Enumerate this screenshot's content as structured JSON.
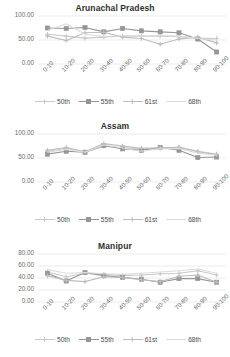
{
  "figure": {
    "categories": [
      "0-10",
      "10-20",
      "20-30",
      "30-40",
      "40-50",
      "50-60",
      "60-70",
      "70-80",
      "80-90",
      "90-100"
    ],
    "legend": [
      {
        "label": "50th",
        "color": "#c9c9c9",
        "marker": "cross"
      },
      {
        "label": "55th",
        "color": "#969696",
        "marker": "square"
      },
      {
        "label": "61st",
        "color": "#bdbdbd",
        "marker": "cross"
      },
      {
        "label": "68th",
        "color": "#dcdcdc",
        "marker": "none"
      }
    ]
  },
  "charts": [
    {
      "title": "Arunachal Pradesh",
      "ylim": [
        0,
        100
      ],
      "yticks": [
        "0.00",
        "50.00",
        "100.00"
      ],
      "ytick_values": [
        0,
        50,
        100
      ],
      "chart_data": {
        "type": "line",
        "title": "Arunachal Pradesh",
        "xlabel": "",
        "ylabel": "",
        "ylim": [
          0,
          100
        ],
        "grid": true,
        "legend_position": "bottom",
        "categories": [
          "0-10",
          "10-20",
          "20-30",
          "30-40",
          "40-50",
          "50-60",
          "60-70",
          "70-80",
          "80-90",
          "90-100"
        ],
        "series": [
          {
            "name": "50th",
            "values": [
              62,
              58,
              54,
              56,
              58,
              58,
              58,
              57,
              54,
              53
            ]
          },
          {
            "name": "55th",
            "values": [
              75,
              74,
              76,
              67,
              74,
              69,
              67,
              65,
              52,
              25
            ]
          },
          {
            "name": "61st",
            "values": [
              58,
              49,
              65,
              66,
              56,
              53,
              41,
              52,
              56,
              44
            ]
          },
          {
            "name": "68th",
            "values": [
              70,
              84,
              62,
              57,
              59,
              58,
              59,
              58,
              53,
              50
            ]
          }
        ]
      }
    },
    {
      "title": "Assam",
      "ylim": [
        0,
        100
      ],
      "yticks": [
        "0.00",
        "50.00",
        "100.00"
      ],
      "ytick_values": [
        0,
        50,
        100
      ],
      "chart_data": {
        "type": "line",
        "title": "Assam",
        "xlabel": "",
        "ylabel": "",
        "ylim": [
          0,
          100
        ],
        "grid": true,
        "legend_position": "bottom",
        "categories": [
          "0-10",
          "10-20",
          "20-30",
          "30-40",
          "40-50",
          "50-60",
          "60-70",
          "70-80",
          "80-90",
          "90-100"
        ],
        "series": [
          {
            "name": "50th",
            "values": [
              64,
              70,
              62,
              74,
              72,
              68,
              70,
              73,
              64,
              58
            ]
          },
          {
            "name": "55th",
            "values": [
              58,
              64,
              62,
              76,
              69,
              66,
              72,
              66,
              51,
              52
            ]
          },
          {
            "name": "61st",
            "values": [
              66,
              72,
              63,
              80,
              75,
              70,
              71,
              72,
              63,
              57
            ]
          },
          {
            "name": "68th",
            "values": [
              62,
              68,
              62,
              77,
              71,
              64,
              69,
              70,
              60,
              56
            ]
          }
        ]
      }
    },
    {
      "title": "Manipur",
      "ylim": [
        0,
        80
      ],
      "yticks": [
        "0.00",
        "20.00",
        "40.00",
        "60.00",
        "80.00"
      ],
      "ytick_values": [
        0,
        20,
        40,
        60,
        80
      ],
      "chart_data": {
        "type": "line",
        "title": "Manipur",
        "xlabel": "",
        "ylabel": "",
        "ylim": [
          0,
          80
        ],
        "grid": true,
        "legend_position": "bottom",
        "categories": [
          "0-10",
          "10-20",
          "20-30",
          "30-40",
          "40-50",
          "50-60",
          "60-70",
          "70-80",
          "80-90",
          "90-100"
        ],
        "series": [
          {
            "name": "50th",
            "values": [
              50,
              42,
              48,
              46,
              44,
              45,
              47,
              48,
              52,
              45
            ]
          },
          {
            "name": "55th",
            "values": [
              48,
              35,
              49,
              44,
              41,
              38,
              33,
              39,
              39,
              33
            ]
          },
          {
            "name": "61st",
            "values": [
              44,
              36,
              34,
              42,
              41,
              37,
              34,
              43,
              45,
              33
            ]
          },
          {
            "name": "68th",
            "values": [
              54,
              48,
              49,
              47,
              46,
              48,
              50,
              52,
              55,
              48
            ]
          }
        ]
      }
    }
  ]
}
